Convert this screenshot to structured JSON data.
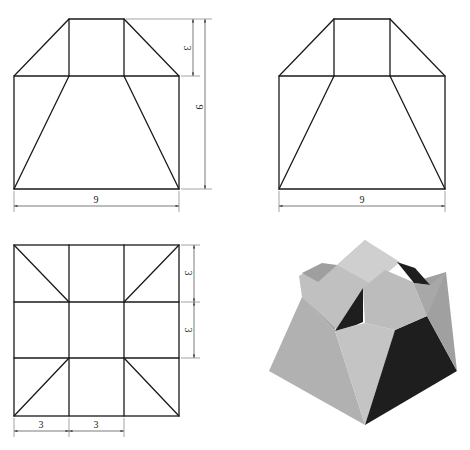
{
  "figure": {
    "views": {
      "front": {
        "label_width": "9",
        "label_height_total": "9",
        "label_height_top": "3"
      },
      "side": {
        "label_width": "9"
      },
      "top": {
        "label_x1": "3",
        "label_x2": "3",
        "label_y1": "3",
        "label_y2": "3"
      },
      "isometric": {
        "colors": {
          "light": "#c9c9c9",
          "mid": "#a9a9a9",
          "dark": "#1e1e1e",
          "top": "#bdbdbd"
        }
      }
    }
  }
}
